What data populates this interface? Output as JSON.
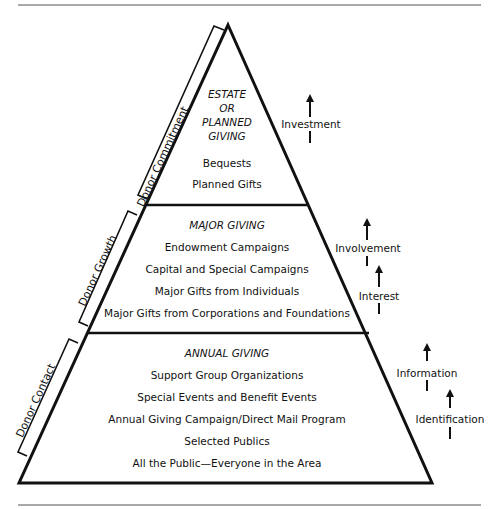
{
  "diagram": {
    "type": "fundraising-pyramid",
    "tiers": [
      {
        "title_lines": [
          "ESTATE",
          "OR",
          "PLANNED",
          "GIVING"
        ],
        "items": [
          "Bequests",
          "Planned Gifts"
        ]
      },
      {
        "title_lines": [
          "MAJOR GIVING"
        ],
        "items": [
          "Endowment Campaigns",
          "Capital and Special Campaigns",
          "Major Gifts from Individuals",
          "Major Gifts from Corporations and Foundations"
        ]
      },
      {
        "title_lines": [
          "ANNUAL GIVING"
        ],
        "items": [
          "Support Group Organizations",
          "Special Events and Benefit Events",
          "Annual Giving Campaign/Direct Mail Program",
          "Selected Publics",
          "All the Public—Everyone in the Area"
        ]
      }
    ],
    "side_brackets": [
      "Donor Commitment",
      "Donor Growth",
      "Donor Contact"
    ],
    "progression_labels": [
      "Investment",
      "Involvement",
      "Interest",
      "Information",
      "Identification"
    ]
  }
}
